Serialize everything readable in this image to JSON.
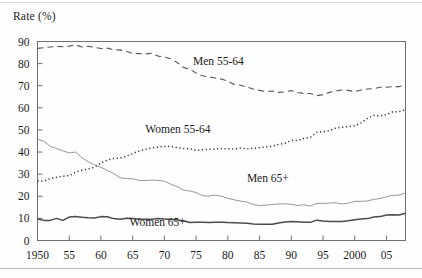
{
  "chart_data": {
    "type": "line",
    "title": "",
    "ylabel": "Rate (%)",
    "xlabel": "",
    "ylim": [
      0,
      90
    ],
    "xlim": [
      1950,
      2008
    ],
    "ytick_step": 10,
    "grid": false,
    "legend_position": "inline-annotations",
    "yticks": [
      "0",
      "10",
      "20",
      "30",
      "40",
      "50",
      "60",
      "70",
      "80",
      "90"
    ],
    "xticks": [
      "1950",
      "55",
      "60",
      "65",
      "70",
      "75",
      "80",
      "85",
      "90",
      "95",
      "2000",
      "05"
    ],
    "xtick_years": [
      1950,
      1955,
      1960,
      1965,
      1970,
      1975,
      1980,
      1985,
      1990,
      1995,
      2000,
      2005
    ],
    "x": [
      1950,
      1951,
      1952,
      1953,
      1954,
      1955,
      1956,
      1957,
      1958,
      1959,
      1960,
      1961,
      1962,
      1963,
      1964,
      1965,
      1966,
      1967,
      1968,
      1969,
      1970,
      1971,
      1972,
      1973,
      1974,
      1975,
      1976,
      1977,
      1978,
      1979,
      1980,
      1981,
      1982,
      1983,
      1984,
      1985,
      1986,
      1987,
      1988,
      1989,
      1990,
      1991,
      1992,
      1993,
      1994,
      1995,
      1996,
      1997,
      1998,
      1999,
      2000,
      2001,
      2002,
      2003,
      2004,
      2005,
      2006,
      2007,
      2008
    ],
    "series": [
      {
        "name": "Men 55-64",
        "style": "dashed",
        "color": "#555555",
        "label": "Men 55-64",
        "values": [
          86.9,
          87.2,
          87.5,
          87.8,
          87.6,
          87.9,
          88.5,
          87.5,
          87.8,
          87.4,
          86.8,
          87.0,
          86.2,
          86.2,
          85.6,
          84.6,
          84.5,
          84.4,
          84.7,
          83.4,
          83.0,
          82.2,
          80.5,
          78.3,
          77.4,
          75.8,
          74.5,
          74.0,
          73.5,
          73.0,
          72.1,
          70.6,
          70.2,
          69.4,
          68.5,
          67.9,
          67.3,
          67.6,
          67.0,
          67.2,
          67.8,
          66.9,
          66.5,
          66.5,
          65.5,
          66.0,
          67.0,
          67.6,
          68.1,
          67.9,
          67.3,
          68.1,
          68.5,
          68.7,
          69.3,
          69.3,
          69.6,
          69.6,
          70.4
        ]
      },
      {
        "name": "Women 55-64",
        "style": "dotted",
        "color": "#333333",
        "label": "Women 55-64",
        "values": [
          27.0,
          26.8,
          28.0,
          28.6,
          29.1,
          29.3,
          30.9,
          31.8,
          32.3,
          33.2,
          35.0,
          36.4,
          37.1,
          37.3,
          38.1,
          39.4,
          40.4,
          41.2,
          41.8,
          42.3,
          42.5,
          42.6,
          42.0,
          41.6,
          41.5,
          40.7,
          41.0,
          41.2,
          41.3,
          41.6,
          41.5,
          41.4,
          41.8,
          41.5,
          41.7,
          42.0,
          42.3,
          42.7,
          43.5,
          44.0,
          45.2,
          45.2,
          46.2,
          46.6,
          48.9,
          49.2,
          49.6,
          50.9,
          51.2,
          51.5,
          51.9,
          53.2,
          55.2,
          56.6,
          56.3,
          57.0,
          58.2,
          58.3,
          59.1
        ]
      },
      {
        "name": "Men 65+",
        "style": "solid-thin",
        "color": "#8b8b8b",
        "label": "Men 65+",
        "values": [
          45.8,
          44.9,
          42.6,
          41.6,
          40.5,
          39.6,
          40.0,
          37.5,
          35.6,
          34.2,
          33.1,
          31.7,
          30.3,
          28.4,
          28.0,
          27.9,
          27.2,
          27.1,
          27.3,
          27.2,
          26.8,
          25.5,
          24.4,
          22.8,
          22.4,
          21.7,
          20.3,
          20.1,
          20.5,
          20.0,
          19.1,
          18.4,
          17.8,
          17.4,
          16.3,
          15.8,
          16.0,
          16.3,
          16.5,
          16.6,
          16.4,
          15.8,
          16.2,
          15.6,
          16.8,
          16.8,
          16.9,
          17.1,
          16.5,
          16.9,
          17.7,
          17.7,
          17.9,
          18.6,
          19.0,
          19.8,
          20.4,
          20.5,
          21.5
        ]
      },
      {
        "name": "Women 65+",
        "style": "solid-thick",
        "color": "#4a4a4a",
        "label": "Women 65+",
        "values": [
          9.7,
          9.1,
          9.1,
          10.0,
          9.1,
          10.6,
          10.8,
          10.5,
          10.3,
          10.2,
          10.8,
          10.7,
          9.9,
          9.6,
          10.1,
          10.0,
          9.6,
          9.6,
          9.6,
          9.9,
          9.7,
          9.5,
          9.3,
          8.9,
          8.1,
          8.2,
          8.2,
          8.1,
          8.3,
          8.3,
          8.1,
          8.0,
          7.9,
          7.8,
          7.5,
          7.3,
          7.4,
          7.4,
          7.9,
          8.4,
          8.6,
          8.5,
          8.3,
          8.2,
          9.2,
          8.8,
          8.6,
          8.6,
          8.6,
          8.9,
          9.4,
          9.7,
          9.9,
          10.6,
          10.8,
          11.5,
          11.7,
          11.5,
          12.3
        ]
      }
    ]
  },
  "annotations": [
    {
      "name": "men-55-64",
      "text": "Men 55-64",
      "x_year": 1974.5,
      "y_value": 79.5
    },
    {
      "name": "women-55-64",
      "text": "Women 55-64",
      "x_year": 1967.0,
      "y_value": 48.5
    },
    {
      "name": "men-65-plus",
      "text": "Men 65+",
      "x_year": 1983.0,
      "y_value": 26.5
    },
    {
      "name": "women-65-plus",
      "text": "Women 65+",
      "x_year": 1964.5,
      "y_value": 6.5
    }
  ]
}
